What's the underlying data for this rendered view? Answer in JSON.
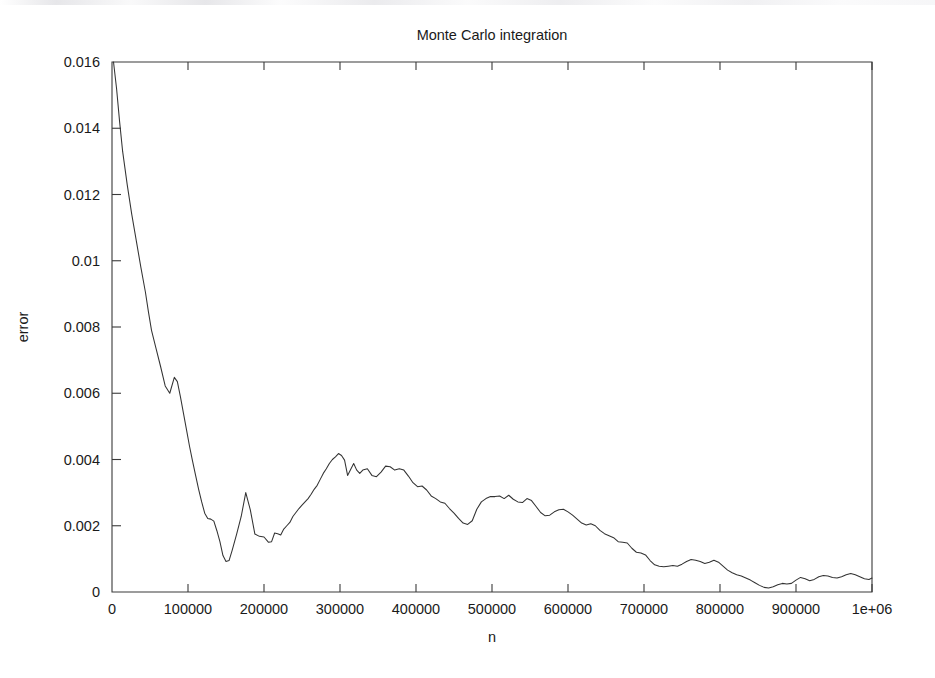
{
  "chart_data": {
    "type": "line",
    "title": "Monte Carlo integration",
    "xlabel": "n",
    "ylabel": "error",
    "xlim": [
      0,
      1000000
    ],
    "ylim": [
      0,
      0.016
    ],
    "grid": false,
    "legend": null,
    "xticks": [
      0,
      100000,
      200000,
      300000,
      400000,
      500000,
      600000,
      700000,
      800000,
      900000,
      1000000
    ],
    "xticklabels": [
      "0",
      "100000",
      "200000",
      "300000",
      "400000",
      "500000",
      "600000",
      "700000",
      "800000",
      "900000",
      "1e+06"
    ],
    "yticks": [
      0,
      0.002,
      0.004,
      0.006,
      0.008,
      0.01,
      0.012,
      0.014,
      0.016
    ],
    "yticklabels": [
      "0",
      "0.002",
      "0.004",
      "0.006",
      "0.008",
      "0.01",
      "0.012",
      "0.014",
      "0.016"
    ],
    "line_color": "#333333",
    "series": [
      {
        "name": "error",
        "x": [
          2000,
          6000,
          10000,
          14000,
          20000,
          26000,
          32000,
          38000,
          44000,
          48000,
          52000,
          58000,
          64000,
          70000,
          76000,
          82000,
          86000,
          90000,
          94000,
          98000,
          102000,
          106000,
          110000,
          114000,
          118000,
          122000,
          126000,
          130000,
          134000,
          138000,
          142000,
          146000,
          150000,
          154000,
          158000,
          164000,
          170000,
          176000,
          182000,
          188000,
          194000,
          200000,
          206000,
          210000,
          214000,
          218000,
          222000,
          226000,
          230000,
          234000,
          238000,
          242000,
          246000,
          250000,
          254000,
          258000,
          262000,
          266000,
          270000,
          274000,
          278000,
          282000,
          286000,
          290000,
          294000,
          298000,
          302000,
          306000,
          310000,
          314000,
          318000,
          322000,
          326000,
          330000,
          336000,
          342000,
          348000,
          354000,
          360000,
          366000,
          372000,
          378000,
          384000,
          390000,
          396000,
          402000,
          408000,
          414000,
          420000,
          426000,
          432000,
          438000,
          444000,
          450000,
          456000,
          462000,
          468000,
          474000,
          480000,
          486000,
          492000,
          498000,
          504000,
          510000,
          516000,
          522000,
          528000,
          534000,
          540000,
          546000,
          552000,
          558000,
          564000,
          570000,
          576000,
          582000,
          588000,
          594000,
          600000,
          606000,
          612000,
          618000,
          624000,
          630000,
          636000,
          642000,
          648000,
          654000,
          660000,
          666000,
          672000,
          678000,
          684000,
          690000,
          696000,
          702000,
          708000,
          714000,
          720000,
          726000,
          732000,
          738000,
          744000,
          750000,
          756000,
          762000,
          768000,
          774000,
          780000,
          786000,
          792000,
          798000,
          804000,
          810000,
          816000,
          822000,
          828000,
          834000,
          840000,
          846000,
          852000,
          858000,
          864000,
          870000,
          876000,
          882000,
          888000,
          894000,
          900000,
          906000,
          912000,
          918000,
          924000,
          930000,
          936000,
          942000,
          948000,
          954000,
          960000,
          966000,
          972000,
          978000,
          984000,
          990000,
          996000,
          1000000
        ],
        "y": [
          0.016,
          0.0152,
          0.0142,
          0.0133,
          0.0123,
          0.0114,
          0.0106,
          0.0098,
          0.00905,
          0.00845,
          0.0079,
          0.00735,
          0.0068,
          0.00622,
          0.006,
          0.00648,
          0.00635,
          0.0059,
          0.0054,
          0.0049,
          0.0044,
          0.00395,
          0.00352,
          0.0031,
          0.00272,
          0.00238,
          0.00222,
          0.0022,
          0.00214,
          0.00185,
          0.00152,
          0.0011,
          0.00092,
          0.00095,
          0.00125,
          0.00175,
          0.00228,
          0.003,
          0.00248,
          0.00175,
          0.00168,
          0.00166,
          0.0015,
          0.00152,
          0.00178,
          0.00176,
          0.00172,
          0.0019,
          0.002,
          0.0021,
          0.00228,
          0.0024,
          0.00252,
          0.00262,
          0.00272,
          0.00282,
          0.00295,
          0.0031,
          0.00322,
          0.0034,
          0.00358,
          0.00372,
          0.00388,
          0.004,
          0.00408,
          0.00418,
          0.00412,
          0.00398,
          0.00352,
          0.0037,
          0.00388,
          0.00368,
          0.00358,
          0.00368,
          0.00372,
          0.00352,
          0.00348,
          0.00362,
          0.0038,
          0.00378,
          0.00368,
          0.00372,
          0.00368,
          0.0035,
          0.0033,
          0.00318,
          0.0032,
          0.00308,
          0.0029,
          0.00282,
          0.00272,
          0.00268,
          0.00252,
          0.00238,
          0.00222,
          0.00208,
          0.00204,
          0.00215,
          0.0025,
          0.00272,
          0.00282,
          0.00288,
          0.00288,
          0.0029,
          0.00282,
          0.00292,
          0.0028,
          0.00272,
          0.0027,
          0.00282,
          0.00276,
          0.00258,
          0.0024,
          0.0023,
          0.00232,
          0.00242,
          0.00248,
          0.0025,
          0.00242,
          0.00232,
          0.0022,
          0.00208,
          0.00202,
          0.00206,
          0.002,
          0.00186,
          0.00176,
          0.0017,
          0.00164,
          0.00152,
          0.0015,
          0.00148,
          0.00132,
          0.0012,
          0.00118,
          0.00112,
          0.00095,
          0.00082,
          0.00078,
          0.00076,
          0.00078,
          0.0008,
          0.00078,
          0.00084,
          0.00092,
          0.00098,
          0.00096,
          0.00092,
          0.00086,
          0.0009,
          0.00096,
          0.0009,
          0.00078,
          0.00066,
          0.00058,
          0.00052,
          0.00048,
          0.00042,
          0.00036,
          0.00028,
          0.0002,
          0.00014,
          0.00012,
          0.00016,
          0.00022,
          0.00026,
          0.00024,
          0.00026,
          0.00036,
          0.00044,
          0.0004,
          0.00034,
          0.00038,
          0.00046,
          0.0005,
          0.00048,
          0.00044,
          0.00042,
          0.00046,
          0.00052,
          0.00056,
          0.00052,
          0.00046,
          0.0004,
          0.00038,
          0.00042
        ]
      }
    ]
  }
}
